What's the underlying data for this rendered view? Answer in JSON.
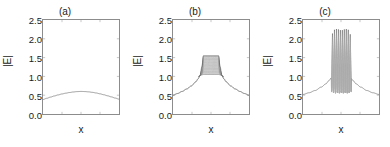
{
  "figure": {
    "panels": [
      {
        "id": "a",
        "title": "(a)",
        "xlabel": "x",
        "ylabel": "|E|"
      },
      {
        "id": "b",
        "title": "(b)",
        "xlabel": "x",
        "ylabel": "|E|"
      },
      {
        "id": "c",
        "title": "(c)",
        "xlabel": "x",
        "ylabel": "|E|"
      }
    ],
    "ytick_labels": [
      "2.5",
      "2.0",
      "1.5",
      "1.0",
      "0.5",
      "0.0"
    ]
  },
  "chart_data": [
    {
      "type": "line",
      "title": "(a)",
      "xlabel": "x",
      "ylabel": "|E|",
      "xlim": [
        0,
        1
      ],
      "ylim": [
        0.0,
        2.5
      ],
      "yticks": [
        0.0,
        0.5,
        1.0,
        1.5,
        2.0,
        2.5
      ],
      "grid": false,
      "legend": "none",
      "series": [
        {
          "name": "|E|",
          "x": [
            0.0,
            0.05,
            0.1,
            0.15,
            0.2,
            0.25,
            0.3,
            0.35,
            0.4,
            0.45,
            0.5,
            0.55,
            0.6,
            0.65,
            0.7,
            0.75,
            0.8,
            0.85,
            0.9,
            0.95,
            1.0
          ],
          "values": [
            0.385,
            0.418,
            0.45,
            0.48,
            0.508,
            0.533,
            0.554,
            0.572,
            0.586,
            0.596,
            0.6,
            0.597,
            0.589,
            0.576,
            0.559,
            0.537,
            0.512,
            0.484,
            0.455,
            0.424,
            0.395
          ]
        }
      ]
    },
    {
      "type": "line",
      "title": "(b)",
      "xlabel": "x",
      "ylabel": "|E|",
      "xlim": [
        0,
        1
      ],
      "ylim": [
        0.0,
        2.5
      ],
      "yticks": [
        0.0,
        0.5,
        1.0,
        1.5,
        2.0,
        2.5
      ],
      "grid": false,
      "legend": "none",
      "description": "Trapezoidal plateau region filled with dense rapid oscillations between an upper envelope near 1.55 and a lower envelope near 1.05",
      "series": [
        {
          "name": "upper envelope",
          "x": [
            0.0,
            0.06,
            0.12,
            0.18,
            0.24,
            0.3,
            0.33,
            0.355,
            0.38,
            0.4,
            0.6,
            0.62,
            0.645,
            0.67,
            0.7,
            0.76,
            0.82,
            0.88,
            0.94,
            1.0
          ],
          "values": [
            0.5,
            0.545,
            0.6,
            0.665,
            0.745,
            0.855,
            0.935,
            1.02,
            1.25,
            1.55,
            1.55,
            1.25,
            1.02,
            0.935,
            0.855,
            0.745,
            0.665,
            0.6,
            0.545,
            0.5
          ]
        },
        {
          "name": "lower envelope",
          "x": [
            0.0,
            0.06,
            0.12,
            0.18,
            0.24,
            0.3,
            0.33,
            0.355,
            0.38,
            0.4,
            0.6,
            0.62,
            0.645,
            0.67,
            0.7,
            0.76,
            0.82,
            0.88,
            0.94,
            1.0
          ],
          "values": [
            0.5,
            0.545,
            0.6,
            0.665,
            0.745,
            0.855,
            0.935,
            1.02,
            1.04,
            1.05,
            1.05,
            1.04,
            1.02,
            0.935,
            0.855,
            0.745,
            0.665,
            0.6,
            0.545,
            0.5
          ]
        }
      ],
      "oscillation": {
        "x_start": 0.345,
        "x_end": 0.655,
        "n_lines": 34
      }
    },
    {
      "type": "line",
      "title": "(c)",
      "xlabel": "x",
      "ylabel": "|E|",
      "xlim": [
        0,
        1
      ],
      "ylim": [
        0.0,
        2.5
      ],
      "yticks": [
        0.0,
        0.5,
        1.0,
        1.5,
        2.0,
        2.5
      ],
      "grid": false,
      "legend": "none",
      "description": "Smooth tails rising to shoulders near 0.95, with a central burst of about 10 rapid high-amplitude spikes peaking near 2.25 and dipping to about 0.55",
      "series": [
        {
          "name": "background envelope",
          "x": [
            0.0,
            0.08,
            0.16,
            0.24,
            0.3,
            0.34,
            0.37,
            0.63,
            0.66,
            0.7,
            0.76,
            0.84,
            0.92,
            1.0
          ],
          "values": [
            0.52,
            0.565,
            0.625,
            0.715,
            0.8,
            0.885,
            0.955,
            0.955,
            0.885,
            0.8,
            0.715,
            0.625,
            0.565,
            0.52
          ]
        },
        {
          "name": "spike peaks",
          "x": [
            0.388,
            0.414,
            0.44,
            0.466,
            0.492,
            0.518,
            0.544,
            0.57,
            0.596,
            0.622
          ],
          "values": [
            2.14,
            2.24,
            2.26,
            2.25,
            2.23,
            2.23,
            2.25,
            2.26,
            2.24,
            2.12
          ]
        },
        {
          "name": "spike troughs",
          "x": [
            0.375,
            0.401,
            0.427,
            0.453,
            0.479,
            0.505,
            0.531,
            0.557,
            0.583,
            0.609,
            0.635
          ],
          "values": [
            0.6,
            0.56,
            0.55,
            0.56,
            0.55,
            0.56,
            0.55,
            0.56,
            0.55,
            0.56,
            0.6
          ]
        }
      ],
      "oscillation": {
        "x_start": 0.372,
        "x_end": 0.638,
        "n_spikes": 10
      }
    }
  ]
}
